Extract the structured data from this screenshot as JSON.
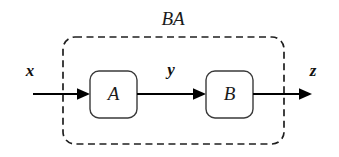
{
  "diagram": {
    "title_label": "BA",
    "background_color": "#ffffff",
    "line_color": "#000000",
    "box_stroke_color": "#3a3a3a",
    "group": {
      "label": "BA",
      "style": "dashed-rounded-rectangle",
      "x": 63,
      "y": 37,
      "width": 221,
      "height": 107,
      "corner_radius": 12,
      "label_x": 173,
      "label_y": 20
    },
    "nodes": [
      {
        "id": "A",
        "label": "A",
        "x": 90,
        "y": 71,
        "width": 47,
        "height": 47,
        "corner_radius": 9,
        "center_x": 113.5,
        "center_y": 95
      },
      {
        "id": "B",
        "label": "B",
        "x": 206,
        "y": 71,
        "width": 47,
        "height": 47,
        "corner_radius": 9,
        "center_x": 229.5,
        "center_y": 95
      }
    ],
    "signals": [
      {
        "id": "x",
        "label": "x",
        "label_x": 30,
        "label_y": 72,
        "arrow_from_x": 33,
        "arrow_to_x": 90,
        "arrow_y": 94
      },
      {
        "id": "y",
        "label": "y",
        "label_x": 171,
        "label_y": 71,
        "arrow_from_x": 137,
        "arrow_to_x": 206,
        "arrow_y": 94
      },
      {
        "id": "z",
        "label": "z",
        "label_x": 313,
        "label_y": 72,
        "arrow_from_x": 253,
        "arrow_to_x": 312,
        "arrow_y": 94
      }
    ]
  }
}
